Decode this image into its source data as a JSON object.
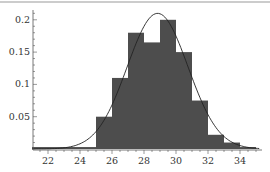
{
  "chart_data": {
    "type": "bar",
    "title": "",
    "xlabel": "",
    "ylabel": "",
    "xlim": [
      21,
      35.5
    ],
    "ylim": [
      0,
      0.22
    ],
    "grid": false,
    "legend": null,
    "bins": [
      {
        "x0": 21,
        "x1": 25,
        "value": 0.003
      },
      {
        "x0": 25,
        "x1": 26,
        "value": 0.05
      },
      {
        "x0": 26,
        "x1": 27,
        "value": 0.11
      },
      {
        "x0": 27,
        "x1": 28,
        "value": 0.18
      },
      {
        "x0": 28,
        "x1": 29,
        "value": 0.165
      },
      {
        "x0": 29,
        "x1": 30,
        "value": 0.2
      },
      {
        "x0": 30,
        "x1": 31,
        "value": 0.15
      },
      {
        "x0": 31,
        "x1": 32,
        "value": 0.075
      },
      {
        "x0": 32,
        "x1": 33,
        "value": 0.022
      },
      {
        "x0": 33,
        "x1": 34,
        "value": 0.01
      },
      {
        "x0": 34,
        "x1": 35,
        "value": 0.003
      }
    ],
    "curve": {
      "type": "normal-density",
      "mean": 28.85,
      "sd": 1.9
    },
    "x_ticks": [
      "22",
      "24",
      "26",
      "28",
      "30",
      "32",
      "34"
    ],
    "y_ticks": [
      "0.05",
      "0.1",
      "0.15",
      "0.2"
    ],
    "bar_color": "#4d4d4d",
    "curve_color": "#222222"
  }
}
